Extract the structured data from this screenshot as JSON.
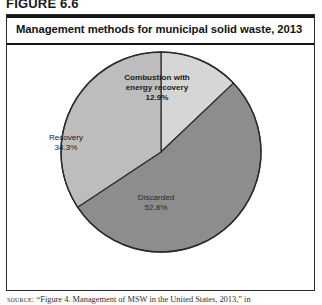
{
  "figure": {
    "label": "FIGURE 6.6",
    "title": "Management methods for municipal solid waste, 2013",
    "source_keyword": "source:",
    "source_text": "“Figure 4. Management of MSW in the United States, 2013,” in"
  },
  "chart_data": {
    "type": "pie",
    "title": "Management methods for municipal solid waste, 2013",
    "xlabel": "",
    "ylabel": "",
    "legend_position": "none",
    "grid": false,
    "start_angle_deg": 0,
    "direction": "clockwise",
    "categories": [
      "Combustion with energy recovery",
      "Discarded",
      "Recovery"
    ],
    "values": [
      12.9,
      52.8,
      34.3
    ],
    "units": "percent",
    "slices": [
      {
        "name": "Combustion with energy recovery",
        "label_line1": "Combustion with",
        "label_line2": "energy recovery",
        "value": 12.9,
        "value_label": "12.9%",
        "color": "#d6d6d6"
      },
      {
        "name": "Discarded",
        "label_line1": "Discarded",
        "label_line2": "",
        "value": 52.8,
        "value_label": "52.8%",
        "color": "#8d8d8d"
      },
      {
        "name": "Recovery",
        "label_line1": "Recovery",
        "label_line2": "",
        "value": 34.3,
        "value_label": "34.3%",
        "color": "#bdbdbd"
      }
    ]
  },
  "colors": {
    "combustion": "#d6d6d6",
    "discarded": "#8d8d8d",
    "recovery": "#bdbdbd",
    "outline": "#2b2b2b",
    "rule": "#161616"
  }
}
